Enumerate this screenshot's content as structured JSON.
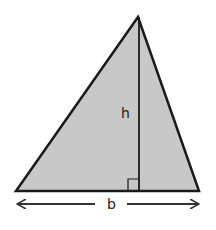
{
  "diagram": {
    "labels": {
      "height": "h",
      "base": "b"
    },
    "colors": {
      "fill": "#c8c8c8",
      "stroke": "#1a1a1a",
      "background": "#ffffff"
    },
    "shapes": {
      "triangle": {
        "apex": [
          138,
          17
        ],
        "bottom_left": [
          16,
          191
        ],
        "bottom_right": [
          199,
          191
        ]
      },
      "height_line": {
        "x": 139,
        "y1": 17,
        "y2": 191
      },
      "right_angle_marker": {
        "x": 128,
        "y": 179,
        "size": 11
      },
      "base_arrow": {
        "y": 204,
        "left_start": 16,
        "left_end": 95,
        "right_start": 127,
        "right_end": 200
      }
    }
  }
}
